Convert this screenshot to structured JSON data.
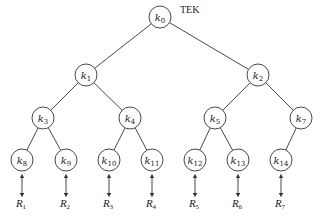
{
  "diagram": {
    "title": "TEK",
    "type": "binary-key-tree",
    "node_radius": 11,
    "nodes": [
      {
        "id": "k0",
        "base": "k",
        "sub": "0",
        "x": 160,
        "y": 17
      },
      {
        "id": "k1",
        "base": "k",
        "sub": "1",
        "x": 86,
        "y": 75
      },
      {
        "id": "k2",
        "base": "k",
        "sub": "2",
        "x": 258,
        "y": 75
      },
      {
        "id": "k3",
        "base": "k",
        "sub": "3",
        "x": 43,
        "y": 118
      },
      {
        "id": "k4",
        "base": "k",
        "sub": "4",
        "x": 130,
        "y": 118
      },
      {
        "id": "k5",
        "base": "k",
        "sub": "5",
        "x": 215,
        "y": 118
      },
      {
        "id": "k7",
        "base": "k",
        "sub": "7",
        "x": 301,
        "y": 118
      },
      {
        "id": "k8",
        "base": "k",
        "sub": "8",
        "x": 22,
        "y": 160
      },
      {
        "id": "k9",
        "base": "k",
        "sub": "9",
        "x": 66,
        "y": 160
      },
      {
        "id": "k10",
        "base": "k",
        "sub": "10",
        "x": 109,
        "y": 160
      },
      {
        "id": "k11",
        "base": "k",
        "sub": "11",
        "x": 152,
        "y": 160
      },
      {
        "id": "k12",
        "base": "k",
        "sub": "12",
        "x": 195,
        "y": 160
      },
      {
        "id": "k13",
        "base": "k",
        "sub": "13",
        "x": 238,
        "y": 160
      },
      {
        "id": "k14",
        "base": "k",
        "sub": "14",
        "x": 281,
        "y": 160
      }
    ],
    "edges": [
      [
        "k0",
        "k1"
      ],
      [
        "k0",
        "k2"
      ],
      [
        "k1",
        "k3"
      ],
      [
        "k1",
        "k4"
      ],
      [
        "k2",
        "k5"
      ],
      [
        "k2",
        "k7"
      ],
      [
        "k3",
        "k8"
      ],
      [
        "k3",
        "k9"
      ],
      [
        "k4",
        "k10"
      ],
      [
        "k4",
        "k11"
      ],
      [
        "k5",
        "k12"
      ],
      [
        "k5",
        "k13"
      ],
      [
        "k7",
        "k14"
      ]
    ],
    "receivers": [
      {
        "base": "R",
        "sub": "1",
        "attached_to": "k8"
      },
      {
        "base": "R",
        "sub": "2",
        "attached_to": "k9"
      },
      {
        "base": "R",
        "sub": "3",
        "attached_to": "k10"
      },
      {
        "base": "R",
        "sub": "4",
        "attached_to": "k11"
      },
      {
        "base": "R",
        "sub": "5",
        "attached_to": "k12"
      },
      {
        "base": "R",
        "sub": "6",
        "attached_to": "k13"
      },
      {
        "base": "R",
        "sub": "7",
        "attached_to": "k14"
      }
    ]
  }
}
